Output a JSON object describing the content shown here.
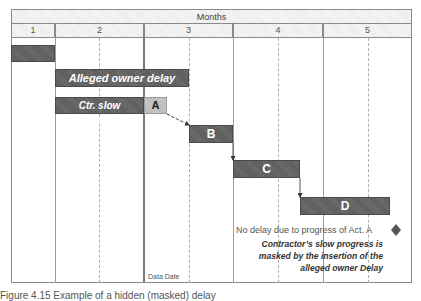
{
  "header": {
    "group_label": "Months",
    "months": [
      "1",
      "2",
      "3",
      "4",
      "5"
    ]
  },
  "bars": [
    {
      "id": "pre",
      "label": ""
    },
    {
      "id": "owner_delay",
      "label": "Alleged owner delay"
    },
    {
      "id": "ctr_slow",
      "label": "Ctr. slow progress"
    },
    {
      "id": "A",
      "label": "A"
    },
    {
      "id": "B",
      "label": "B"
    },
    {
      "id": "C",
      "label": "C"
    },
    {
      "id": "D",
      "label": "D"
    }
  ],
  "data_date_label": "Data Date",
  "annotations": {
    "milestone_note": "No delay due to progress of Act. A",
    "explanation_line1": "Contractor’s slow progress is",
    "explanation_line2": "masked by the insertion of the",
    "explanation_line3": "alleged owner Delay"
  },
  "caption": "Figure 4.15 Example of a hidden (masked) delay",
  "colors": {
    "bar_dark": "#5b5b5b",
    "bar_light": "#c0c0c0",
    "grid": "#9a9a9a",
    "milestone": "#555555"
  }
}
